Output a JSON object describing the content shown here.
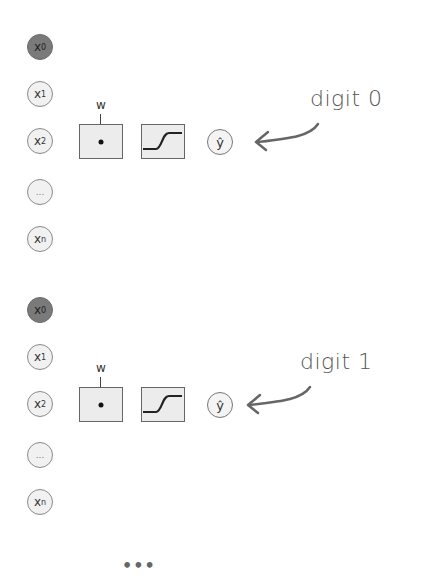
{
  "groups": [
    {
      "inputs": [
        {
          "var": "x",
          "sub": "0",
          "role": "bias"
        },
        {
          "var": "x",
          "sub": "1",
          "role": "input"
        },
        {
          "var": "x",
          "sub": "2",
          "role": "input"
        },
        {
          "var": "...",
          "sub": "",
          "role": "ellipsis"
        },
        {
          "var": "x",
          "sub": "n",
          "role": "input"
        }
      ],
      "weight_label": "w",
      "dot_product_symbol": "•",
      "activation": "sigmoid",
      "output": "ŷ",
      "annotation": "digit 0"
    },
    {
      "inputs": [
        {
          "var": "x",
          "sub": "0",
          "role": "bias"
        },
        {
          "var": "x",
          "sub": "1",
          "role": "input"
        },
        {
          "var": "x",
          "sub": "2",
          "role": "input"
        },
        {
          "var": "...",
          "sub": "",
          "role": "ellipsis"
        },
        {
          "var": "x",
          "sub": "n",
          "role": "input"
        }
      ],
      "weight_label": "w",
      "dot_product_symbol": "•",
      "activation": "sigmoid",
      "output": "ŷ",
      "annotation": "digit 1"
    }
  ],
  "continuation": "•••",
  "colors": {
    "bias_node": "#7a7a7a",
    "input_node": "#f1f1f1",
    "box_fill": "#ececec",
    "stroke": "#666666",
    "annotation": "#555555"
  }
}
